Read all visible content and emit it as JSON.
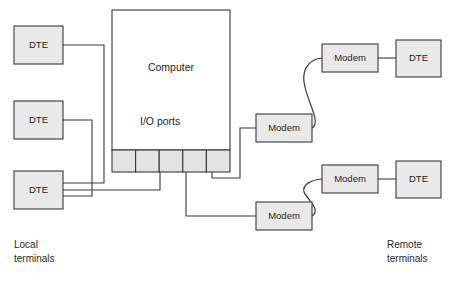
{
  "diagram": {
    "colors": {
      "box_fill": "#e9e9e9",
      "port_fill": "#e3e3e3",
      "computer_fill": "#ffffff",
      "stroke": "#3a3a3a",
      "background": "#ffffff",
      "text": "#1d1d1d"
    },
    "computer": {
      "label": "Computer",
      "ports_label": "I/O ports",
      "port_count": 5
    },
    "local_terminals": {
      "caption_line1": "Local",
      "caption_line2": "terminals",
      "nodes": [
        {
          "label": "DTE"
        },
        {
          "label": "DTE"
        },
        {
          "label": "DTE"
        }
      ]
    },
    "local_modems": [
      {
        "label": "Modem"
      },
      {
        "label": "Modem"
      }
    ],
    "remote_terminals": {
      "caption_line1": "Remote",
      "caption_line2": "terminals",
      "pairs": [
        {
          "modem_label": "Modem",
          "dte_label": "DTE"
        },
        {
          "modem_label": "Modem",
          "dte_label": "DTE"
        }
      ]
    }
  }
}
